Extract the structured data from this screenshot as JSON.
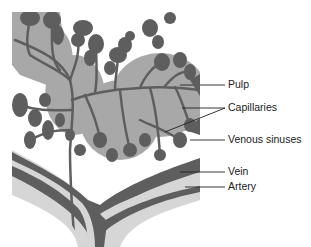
{
  "figure": {
    "colors": {
      "vessel_dark": "#5e5e5e",
      "pulp_gray": "#a8a8a8",
      "wall_light": "#d6d6d6",
      "background": "#ffffff",
      "leader_line": "#222222"
    }
  },
  "labels": [
    {
      "id": "pulp",
      "text": "Pulp"
    },
    {
      "id": "capillaries",
      "text": "Capillaries"
    },
    {
      "id": "venous-sinuses",
      "text": "Venous sinuses"
    },
    {
      "id": "vein",
      "text": "Vein"
    },
    {
      "id": "artery",
      "text": "Artery"
    }
  ]
}
